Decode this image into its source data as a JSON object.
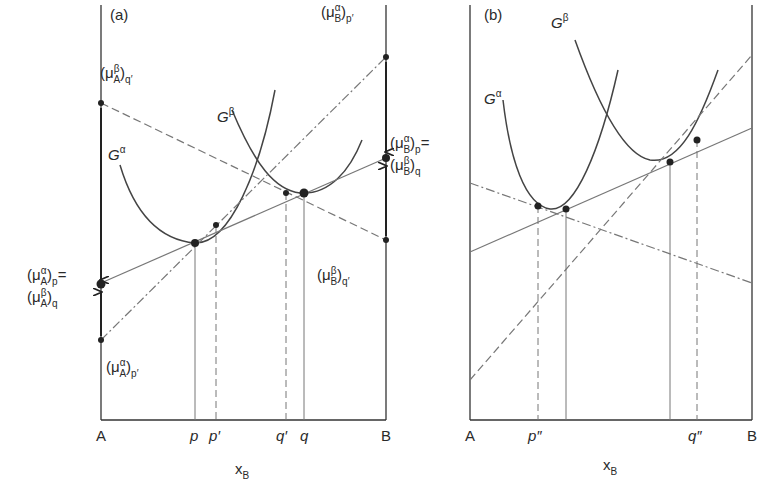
{
  "figure": {
    "panels": [
      {
        "id": "a",
        "panel_label": "(a)",
        "axis_left": "A",
        "axis_right": "B",
        "x_axis_title": "x",
        "x_axis_title_sub": "B",
        "x_ticks": [
          "p",
          "p′",
          "q′",
          "q"
        ],
        "curves": [
          {
            "name": "G",
            "sup": "α"
          },
          {
            "name": "G",
            "sup": "β"
          }
        ],
        "labels": {
          "muA_beta_qprime": {
            "base": "(μ",
            "sup": "β",
            "sub": "A",
            "tail": ")",
            "tail_sub": "q′"
          },
          "muA_alpha_p": {
            "base": "(μ",
            "sup": "α",
            "sub": "A",
            "tail": ")",
            "tail_sub": "p",
            "suffix": "="
          },
          "muA_beta_q": {
            "base": "(μ",
            "sup": "β",
            "sub": "A",
            "tail": ")",
            "tail_sub": "q"
          },
          "muA_alpha_pprime": {
            "base": "(μ",
            "sup": "α",
            "sub": "A",
            "tail": ")",
            "tail_sub": "p′"
          },
          "muB_alpha_pprime": {
            "base": "(μ",
            "sup": "α",
            "sub": "B",
            "tail": ")",
            "tail_sub": "p′"
          },
          "muB_alpha_p": {
            "base": "(μ",
            "sup": "α",
            "sub": "B",
            "tail": ")",
            "tail_sub": "p",
            "suffix": "="
          },
          "muB_beta_q": {
            "base": "(μ",
            "sup": "β",
            "sub": "B",
            "tail": ")",
            "tail_sub": "q"
          },
          "muB_beta_qprime": {
            "base": "(μ",
            "sup": "β",
            "sub": "B",
            "tail": ")",
            "tail_sub": "q′"
          }
        },
        "line_styles": {
          "common_tangent": "solid",
          "tangent_alpha_at_pprime": "dash-dot",
          "tangent_beta_at_qprime": "dashed"
        }
      },
      {
        "id": "b",
        "panel_label": "(b)",
        "axis_left": "A",
        "axis_right": "B",
        "x_axis_title": "x",
        "x_axis_title_sub": "B",
        "x_ticks": [
          "p″",
          "q″"
        ],
        "curves": [
          {
            "name": "G",
            "sup": "α"
          },
          {
            "name": "G",
            "sup": "β"
          }
        ],
        "line_styles": {
          "common_tangent": "solid",
          "tangent_dash_dot": "dash-dot",
          "tangent_dashed": "dashed"
        }
      }
    ]
  }
}
